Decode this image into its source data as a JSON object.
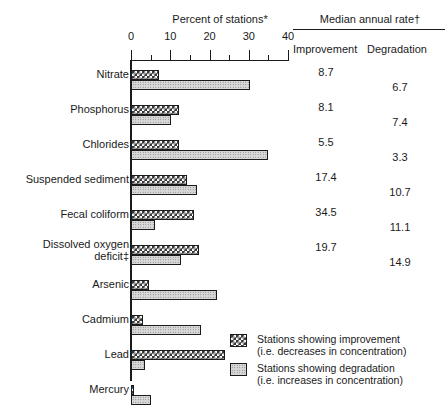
{
  "header": {
    "percent_title": "Percent of stations*",
    "median_title": "Median annual rate†",
    "improvement_col": "Improvement",
    "degradation_col": "Degradation"
  },
  "legend": {
    "improve_line1": "Stations showing improvement",
    "improve_line2": "(i.e. decreases in concentration)",
    "degrade_line1": "Stations showing degradation",
    "degrade_line2": "(i.e. increases in concentration)"
  },
  "axis": {
    "ticks": [
      "0",
      "10",
      "20",
      "30",
      "40"
    ]
  },
  "rows": [
    {
      "label": "Nitrate",
      "improve_pct": 7.1,
      "degrade_pct": 30.3,
      "improve_rate": "8.7",
      "degrade_rate": "6.7"
    },
    {
      "label": "Phosphorus",
      "improve_pct": 12.2,
      "degrade_pct": 10.2,
      "improve_rate": "8.1",
      "degrade_rate": "7.4"
    },
    {
      "label": "Chlorides",
      "improve_pct": 12.2,
      "degrade_pct": 34.9,
      "improve_rate": "5.5",
      "degrade_rate": "3.3"
    },
    {
      "label": "Suspended sediment",
      "improve_pct": 14.2,
      "degrade_pct": 16.8,
      "improve_rate": "17.4",
      "degrade_rate": "10.7"
    },
    {
      "label": "Fecal coliform",
      "improve_pct": 16.0,
      "degrade_pct": 6.1,
      "improve_rate": "34.5",
      "degrade_rate": "11.1"
    },
    {
      "label": "Dissolved oxygen\ndeficit‡",
      "improve_pct": 17.3,
      "degrade_pct": 12.7,
      "improve_rate": "19.7",
      "degrade_rate": "14.9"
    },
    {
      "label": "Arsenic",
      "improve_pct": 4.6,
      "degrade_pct": 21.9,
      "improve_rate": "",
      "degrade_rate": ""
    },
    {
      "label": "Cadmium",
      "improve_pct": 3.1,
      "degrade_pct": 17.8,
      "improve_rate": "",
      "degrade_rate": ""
    },
    {
      "label": "Lead",
      "improve_pct": 23.9,
      "degrade_pct": 3.6,
      "improve_rate": "",
      "degrade_rate": ""
    },
    {
      "label": "Mercury",
      "improve_pct": 0.8,
      "degrade_pct": 5.1,
      "improve_rate": "",
      "degrade_rate": ""
    }
  ],
  "chart_data": {
    "type": "bar",
    "title": "Percent of stations*",
    "xlabel": "Percent of stations*",
    "ylabel": "",
    "xlim": [
      0,
      40
    ],
    "grid": false,
    "orientation": "horizontal",
    "legend_position": "bottom-right",
    "categories": [
      "Nitrate",
      "Phosphorus",
      "Chlorides",
      "Suspended sediment",
      "Fecal coliform",
      "Dissolved oxygen deficit‡",
      "Arsenic",
      "Cadmium",
      "Lead",
      "Mercury"
    ],
    "series": [
      {
        "name": "Stations showing improvement (i.e. decreases in concentration)",
        "values": [
          7.1,
          12.2,
          12.2,
          14.2,
          16.0,
          17.3,
          4.6,
          3.1,
          23.9,
          0.8
        ]
      },
      {
        "name": "Stations showing degradation (i.e. increases in concentration)",
        "values": [
          30.3,
          10.2,
          34.9,
          16.8,
          6.1,
          12.7,
          21.9,
          17.8,
          3.6,
          5.1
        ]
      }
    ],
    "annotations": {
      "table_title": "Median annual rate†",
      "columns": [
        "Improvement",
        "Degradation"
      ],
      "rows": [
        {
          "category": "Nitrate",
          "improvement": "8.7",
          "degradation": "6.7"
        },
        {
          "category": "Phosphorus",
          "improvement": "8.1",
          "degradation": "7.4"
        },
        {
          "category": "Chlorides",
          "improvement": "5.5",
          "degradation": "3.3"
        },
        {
          "category": "Suspended sediment",
          "improvement": "17.4",
          "degradation": "10.7"
        },
        {
          "category": "Fecal coliform",
          "improvement": "34.5",
          "degradation": "11.1"
        },
        {
          "category": "Dissolved oxygen deficit‡",
          "improvement": "19.7",
          "degradation": "14.9"
        },
        {
          "category": "Arsenic",
          "improvement": "",
          "degradation": ""
        },
        {
          "category": "Cadmium",
          "improvement": "",
          "degradation": ""
        },
        {
          "category": "Lead",
          "improvement": "",
          "degradation": ""
        },
        {
          "category": "Mercury",
          "improvement": "",
          "degradation": ""
        }
      ]
    },
    "xticks": [
      0,
      10,
      20,
      30,
      40
    ]
  }
}
